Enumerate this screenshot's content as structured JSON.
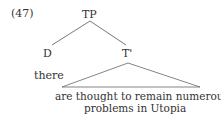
{
  "example_number": "(47)",
  "tree": {
    "root": "TP",
    "left": {
      "label": "D",
      "word": "there"
    },
    "right": {
      "label": "T'",
      "yield_line1": "are thought to remain numerous",
      "yield_line2": "problems in Utopia"
    }
  }
}
